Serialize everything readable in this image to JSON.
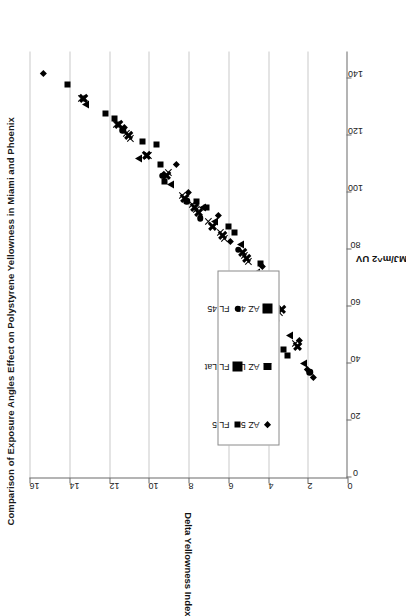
{
  "chart_data": {
    "type": "scatter",
    "title": "Comparison of Exposure Angles Effect on Polystyrene Yellowness in Miami and Phoenix",
    "xlabel": "MJ/m^2 UV",
    "ylabel": "Delta Yellowness Index",
    "xlim": [
      0,
      150
    ],
    "ylim": [
      0,
      16
    ],
    "xticks": [
      "0",
      "20",
      "40",
      "60",
      "80",
      "100",
      "120",
      "140"
    ],
    "xtick_values": [
      0,
      20,
      40,
      60,
      80,
      100,
      120,
      140
    ],
    "yticks": [
      "0",
      "2",
      "4",
      "6",
      "8",
      "10",
      "12",
      "14",
      "16"
    ],
    "ytick_values": [
      0,
      2,
      4,
      6,
      8,
      10,
      12,
      14,
      16
    ],
    "grid": "vertical-only (gridlines along Delta Yellowness Index axis)",
    "legend_position": "inside lower-left of plot area",
    "marker_color": "#000000",
    "series": [
      {
        "name": "AZ 5",
        "marker": "diamond",
        "points": [
          [
            142,
            15.3
          ],
          [
            123,
            11.2
          ],
          [
            110,
            8.6
          ],
          [
            100,
            8.0
          ],
          [
            92,
            6.5
          ],
          [
            83,
            5.9
          ],
          [
            74,
            4.3
          ],
          [
            60,
            3.5
          ],
          [
            48,
            2.4
          ],
          [
            38,
            2.0
          ],
          [
            35,
            1.7
          ]
        ]
      },
      {
        "name": "FL 5",
        "marker": "square",
        "points": [
          [
            138,
            14.1
          ],
          [
            128,
            12.2
          ],
          [
            126,
            11.7
          ],
          [
            118,
            10.3
          ],
          [
            117,
            9.6
          ],
          [
            110,
            9.4
          ],
          [
            104,
            9.2
          ],
          [
            97,
            7.6
          ],
          [
            95,
            7.1
          ],
          [
            88,
            6.0
          ],
          [
            86,
            5.7
          ],
          [
            75,
            4.4
          ],
          [
            57,
            4.2
          ],
          [
            45,
            3.2
          ],
          [
            43,
            3.0
          ]
        ]
      },
      {
        "name": "AZ Lat",
        "marker": "triangle",
        "points": [
          [
            131,
            13.2
          ],
          [
            112,
            10.5
          ],
          [
            103,
            8.9
          ],
          [
            95,
            7.3
          ],
          [
            90,
            6.7
          ],
          [
            82,
            5.4
          ],
          [
            72,
            4.6
          ],
          [
            62,
            3.7
          ],
          [
            50,
            2.9
          ],
          [
            40,
            2.2
          ]
        ]
      },
      {
        "name": "FL Lat",
        "marker": "x",
        "points": [
          [
            133,
            13.4
          ],
          [
            124,
            11.6
          ],
          [
            121,
            11.1
          ],
          [
            119,
            10.9
          ],
          [
            113,
            10.0
          ],
          [
            107,
            9.0
          ],
          [
            99,
            8.3
          ],
          [
            96,
            7.8
          ],
          [
            94,
            7.6
          ],
          [
            90,
            7.0
          ],
          [
            86,
            6.4
          ],
          [
            84,
            6.2
          ],
          [
            78,
            5.2
          ],
          [
            76,
            5.0
          ],
          [
            66,
            4.0
          ],
          [
            58,
            3.4
          ],
          [
            47,
            2.6
          ]
        ]
      },
      {
        "name": "AZ 45",
        "marker": "x-bold",
        "points": [
          [
            133,
            13.3
          ],
          [
            124,
            11.5
          ],
          [
            120,
            11.0
          ],
          [
            113,
            10.1
          ],
          [
            106,
            9.1
          ],
          [
            98,
            8.2
          ],
          [
            95,
            7.7
          ],
          [
            93,
            7.5
          ],
          [
            88,
            6.8
          ],
          [
            85,
            6.3
          ],
          [
            79,
            5.3
          ],
          [
            77,
            5.1
          ],
          [
            68,
            4.1
          ],
          [
            59,
            3.3
          ],
          [
            46,
            2.5
          ]
        ]
      },
      {
        "name": "FL 45",
        "marker": "circle",
        "points": [
          [
            122,
            11.3
          ],
          [
            106,
            9.3
          ],
          [
            97,
            8.1
          ],
          [
            91,
            7.4
          ],
          [
            80,
            5.5
          ],
          [
            70,
            4.8
          ],
          [
            55,
            3.6
          ],
          [
            37,
            1.9
          ]
        ]
      }
    ]
  },
  "legend": {
    "items": [
      {
        "label": "AZ 5",
        "marker": "diamond"
      },
      {
        "label": "FL 5",
        "marker": "square"
      },
      {
        "label": "AZ Lat",
        "marker": "triangle"
      },
      {
        "label": "FL Lat",
        "marker": "x"
      },
      {
        "label": "AZ 45",
        "marker": "x-bold"
      },
      {
        "label": "FL 45",
        "marker": "circle"
      }
    ]
  }
}
